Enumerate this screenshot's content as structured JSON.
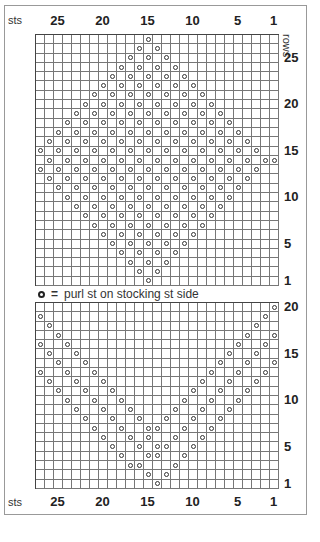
{
  "key": {
    "symbol": "purl-circle",
    "equals": "=",
    "text": "purl st on stocking st side"
  },
  "labels": {
    "sts": "sts",
    "rows": "rows"
  },
  "stitch_labels": [
    "25",
    "20",
    "15",
    "10",
    "5",
    "1"
  ],
  "stitch_label_cols": [
    25,
    20,
    15,
    10,
    5,
    1
  ],
  "top_chart": {
    "cols": 27,
    "rows": 27,
    "row_labels": [
      {
        "row": 25,
        "text": "25"
      },
      {
        "row": 20,
        "text": "20"
      },
      {
        "row": 15,
        "text": "15"
      },
      {
        "row": 10,
        "text": "10"
      },
      {
        "row": 5,
        "text": "5"
      },
      {
        "row": 1,
        "text": "1"
      }
    ],
    "purls": {
      "27": [
        15
      ],
      "26": [
        16,
        14
      ],
      "25": [
        17,
        15,
        13
      ],
      "24": [
        18,
        16,
        14,
        12
      ],
      "23": [
        19,
        17,
        15,
        13,
        11
      ],
      "22": [
        20,
        18,
        16,
        14,
        12,
        10
      ],
      "21": [
        21,
        19,
        17,
        15,
        13,
        11,
        9
      ],
      "20": [
        22,
        20,
        18,
        16,
        14,
        12,
        10,
        8
      ],
      "19": [
        23,
        21,
        19,
        17,
        15,
        13,
        11,
        9,
        7
      ],
      "18": [
        24,
        22,
        20,
        18,
        16,
        14,
        12,
        10,
        8,
        6
      ],
      "17": [
        25,
        23,
        21,
        19,
        17,
        15,
        13,
        11,
        9,
        7,
        5
      ],
      "16": [
        26,
        24,
        22,
        20,
        18,
        16,
        14,
        12,
        10,
        8,
        6,
        4
      ],
      "15": [
        27,
        25,
        23,
        21,
        19,
        17,
        15,
        13,
        11,
        9,
        7,
        5,
        3
      ],
      "14": [
        26,
        24,
        22,
        20,
        18,
        16,
        14,
        12,
        10,
        8,
        6,
        4,
        2,
        1
      ],
      "13": [
        27,
        25,
        23,
        21,
        19,
        17,
        15,
        13,
        11,
        9,
        7,
        5,
        3
      ],
      "12": [
        26,
        24,
        22,
        20,
        18,
        16,
        14,
        12,
        10,
        8,
        6,
        4
      ],
      "11": [
        25,
        23,
        21,
        19,
        17,
        15,
        13,
        11,
        9,
        7,
        5
      ],
      "10": [
        24,
        22,
        20,
        18,
        16,
        14,
        12,
        10,
        8,
        6
      ],
      "9": [
        23,
        21,
        19,
        17,
        15,
        13,
        11,
        9,
        7
      ],
      "8": [
        22,
        20,
        18,
        16,
        14,
        12,
        10,
        8
      ],
      "7": [
        21,
        19,
        17,
        15,
        13,
        11,
        9
      ],
      "6": [
        20,
        18,
        16,
        14,
        12,
        10
      ],
      "5": [
        19,
        17,
        15,
        13,
        11
      ],
      "4": [
        18,
        16,
        14,
        12
      ],
      "3": [
        17,
        15,
        13
      ],
      "2": [
        16,
        14
      ],
      "1": [
        15
      ]
    }
  },
  "bottom_chart": {
    "cols": 27,
    "rows": 20,
    "row_labels": [
      {
        "row": 20,
        "text": "20"
      },
      {
        "row": 15,
        "text": "15"
      },
      {
        "row": 10,
        "text": "10"
      },
      {
        "row": 5,
        "text": "5"
      },
      {
        "row": 1,
        "text": "1"
      }
    ],
    "purls": {
      "20": [
        1
      ],
      "19": [
        27,
        2
      ],
      "18": [
        26,
        3
      ],
      "17": [
        25,
        4,
        1
      ],
      "16": [
        27,
        24,
        5,
        2
      ],
      "15": [
        26,
        23,
        6,
        3
      ],
      "14": [
        25,
        22,
        7,
        4,
        1
      ],
      "13": [
        27,
        24,
        21,
        8,
        5,
        2
      ],
      "12": [
        26,
        23,
        20,
        9,
        6,
        3
      ],
      "11": [
        25,
        22,
        19,
        10,
        7,
        4
      ],
      "10": [
        24,
        21,
        18,
        11,
        8,
        5
      ],
      "9": [
        23,
        20,
        17,
        12,
        9,
        6
      ],
      "8": [
        22,
        19,
        16,
        13,
        10,
        7
      ],
      "7": [
        21,
        18,
        15,
        14,
        11,
        8
      ],
      "6": [
        20,
        17,
        15,
        12,
        9
      ],
      "5": [
        19,
        16,
        14,
        13,
        10
      ],
      "4": [
        18,
        15,
        14,
        11
      ],
      "3": [
        17,
        16,
        12
      ],
      "2": [
        15,
        13
      ],
      "1": [
        14
      ]
    }
  }
}
